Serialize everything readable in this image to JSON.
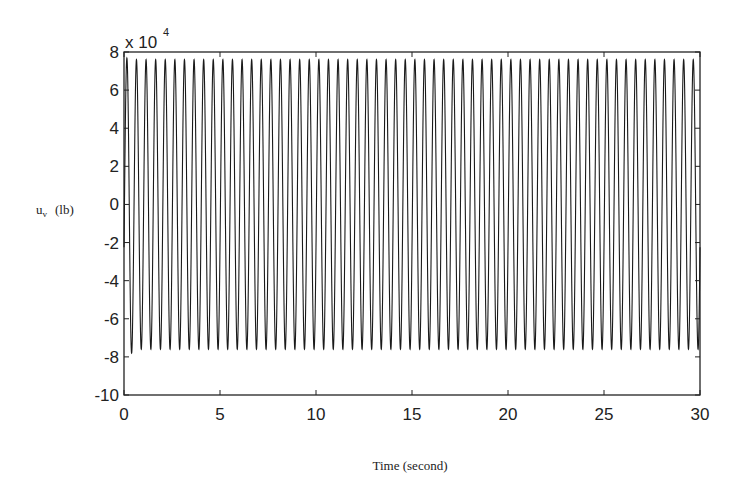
{
  "chart_data": {
    "type": "line",
    "title": "",
    "xlabel": "Time (second)",
    "ylabel_main": "u",
    "ylabel_sub": "v",
    "ylabel_unit": "(lb)",
    "ylabel": "u_v (lb)",
    "y_multiplier": "x 10",
    "y_multiplier_exp": "4",
    "xlim": [
      0,
      30
    ],
    "ylim": [
      -10,
      8
    ],
    "x_ticks": [
      0,
      5,
      10,
      15,
      20,
      25,
      30
    ],
    "y_ticks": [
      8,
      6,
      4,
      2,
      0,
      -2,
      -4,
      -6,
      -8,
      -10
    ],
    "x_tick_labels": [
      "0",
      "5",
      "10",
      "15",
      "20",
      "25",
      "30"
    ],
    "y_tick_labels": [
      "8",
      "6",
      "4",
      "2",
      "0",
      "-2",
      "-4",
      "-6",
      "-8",
      "-10"
    ],
    "grid": false,
    "legend": null,
    "series": [
      {
        "name": "u_v",
        "description": "Sustained sinusoidal oscillation at ~2 Hz (about 60 cycles over 30 s), amplitude approx 7.6 x 10^4 lb, with an initial spike near 8 x 10^4 at t≈0.3 s",
        "frequency_hz": 2.0,
        "amplitude": 7.6,
        "initial_peak": 8.0,
        "color": "#1a1a1a"
      }
    ]
  }
}
